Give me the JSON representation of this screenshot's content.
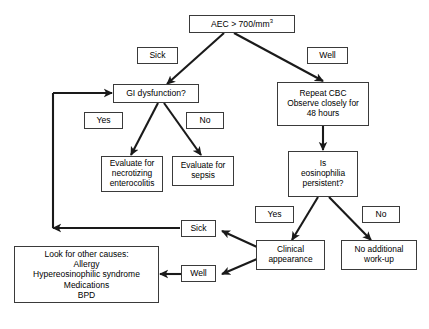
{
  "diagram": {
    "line_color": "#1a1a1a",
    "box_border_color": "#3a3a3a",
    "background_color": "#ffffff",
    "text_color": "#000000"
  },
  "nodes": {
    "aec": {
      "label": "AEC > 700/mm",
      "superscript": "3"
    },
    "sick_top": {
      "label": "Sick"
    },
    "well_top": {
      "label": "Well"
    },
    "gi_dysfunction": {
      "label": "GI dysfunction?"
    },
    "repeat_cbc": {
      "label": "Repeat CBC\nObserve closely for\n48 hours"
    },
    "yes_gi": {
      "label": "Yes"
    },
    "no_gi": {
      "label": "No"
    },
    "evaluate_nec": {
      "label": "Evaluate for\nnecrotizing\nenterocolitis"
    },
    "evaluate_sepsis": {
      "label": "Evaluate for\nsepsis"
    },
    "is_persistent": {
      "label": "Is\neosinophilia\npersistent?"
    },
    "yes_persistent": {
      "label": "Yes"
    },
    "no_persistent": {
      "label": "No"
    },
    "clinical_appearance": {
      "label": "Clinical\nappearance"
    },
    "no_additional_workup": {
      "label": "No additional\nwork-up"
    },
    "sick_bottom": {
      "label": "Sick"
    },
    "well_bottom": {
      "label": "Well"
    },
    "other_causes": {
      "label": "Look for other causes:\nAllergy\nHypereosinophilic syndrome\nMedications\nBPD"
    }
  },
  "edges": [
    {
      "from": "aec",
      "to": "gi_dysfunction",
      "label": "Sick",
      "type": "arrow"
    },
    {
      "from": "aec",
      "to": "repeat_cbc",
      "label": "Well",
      "type": "arrow"
    },
    {
      "from": "gi_dysfunction",
      "to": "evaluate_nec",
      "label": "Yes",
      "type": "arrow"
    },
    {
      "from": "gi_dysfunction",
      "to": "evaluate_sepsis",
      "label": "No",
      "type": "arrow"
    },
    {
      "from": "repeat_cbc",
      "to": "is_persistent",
      "label": "",
      "type": "arrow"
    },
    {
      "from": "is_persistent",
      "to": "clinical_appearance",
      "label": "Yes",
      "type": "arrow"
    },
    {
      "from": "is_persistent",
      "to": "no_additional_workup",
      "label": "No",
      "type": "arrow"
    },
    {
      "from": "clinical_appearance",
      "to": "sick_bottom",
      "label": "",
      "type": "arrow"
    },
    {
      "from": "clinical_appearance",
      "to": "well_bottom",
      "label": "",
      "type": "arrow"
    },
    {
      "from": "sick_bottom",
      "to": "gi_dysfunction",
      "label": "",
      "type": "elbow-arrow"
    },
    {
      "from": "well_bottom",
      "to": "other_causes",
      "label": "",
      "type": "arrow"
    }
  ]
}
